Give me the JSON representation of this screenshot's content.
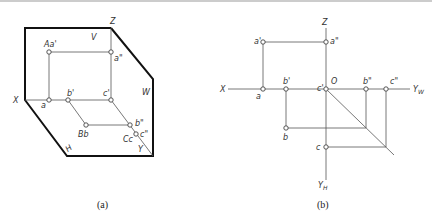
{
  "figure_a": {
    "caption": "(a)",
    "planes": {
      "V": "V",
      "W": "W",
      "H": "H"
    },
    "axes": {
      "X": "X",
      "Z": "Z",
      "Y": "Y"
    },
    "points": {
      "Aa1": "Aa'",
      "a2": "a\"",
      "a": "a",
      "b1": "b'",
      "c1": "c'",
      "Bb": "Bb",
      "b2": "b\"",
      "Cc": "Cc",
      "c2": "c\""
    }
  },
  "figure_b": {
    "caption": "(b)",
    "axes": {
      "X": "X",
      "Z": "Z",
      "O": "O",
      "YW": "Y",
      "YW_sub": "W",
      "YH": "Y",
      "YH_sub": "H"
    },
    "points": {
      "a1": "a'",
      "a2": "a\"",
      "a": "a",
      "b1": "b'",
      "c1": "c'",
      "b2": "b\"",
      "c2": "c\"",
      "b": "b",
      "c": "c"
    }
  }
}
